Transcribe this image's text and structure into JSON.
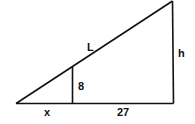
{
  "diagram": {
    "type": "similar right triangles",
    "stroke_color": "#111111",
    "background": "#ffffff",
    "labels": {
      "hypotenuse": "L",
      "height": "h",
      "inner_height": "8",
      "left_base": "x",
      "right_base": "27"
    }
  }
}
